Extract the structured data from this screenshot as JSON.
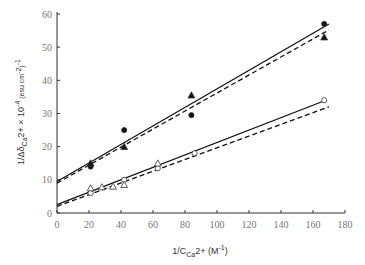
{
  "chart_data": {
    "type": "scatter",
    "title": "",
    "xlabel": "1/C_Ca2+ (M^-1)",
    "ylabel": "1/Δδ_Ca2+ × 10^-4 (esu cm^-2)^-1",
    "xlim": [
      0,
      180
    ],
    "ylim": [
      0,
      60
    ],
    "x_ticks": [
      0,
      20,
      40,
      60,
      80,
      100,
      120,
      140,
      160,
      180
    ],
    "y_ticks": [
      0,
      10,
      20,
      30,
      40,
      50,
      60
    ],
    "grid": false,
    "legend": null,
    "series": [
      {
        "name": "filled-circles",
        "marker": "circle-filled",
        "points": [
          [
            21,
            14
          ],
          [
            42,
            25
          ],
          [
            84,
            29.5
          ],
          [
            167,
            57
          ]
        ]
      },
      {
        "name": "filled-triangles",
        "marker": "triangle-filled",
        "points": [
          [
            21,
            15
          ],
          [
            42,
            20
          ],
          [
            84,
            35.5
          ],
          [
            167,
            53
          ]
        ]
      },
      {
        "name": "open-circles",
        "marker": "circle-open",
        "points": [
          [
            21,
            6
          ],
          [
            42,
            10
          ],
          [
            63,
            13.5
          ],
          [
            86,
            18
          ],
          [
            167,
            34
          ]
        ]
      },
      {
        "name": "open-triangles",
        "marker": "triangle-open",
        "points": [
          [
            21,
            7.5
          ],
          [
            28,
            7.8
          ],
          [
            35,
            8
          ],
          [
            42,
            8.5
          ],
          [
            63,
            15
          ]
        ]
      }
    ],
    "lines": [
      {
        "name": "upper-fit-solid",
        "style": "solid",
        "x": [
          0,
          170
        ],
        "y": [
          9.5,
          57
        ]
      },
      {
        "name": "upper-fit-dashed",
        "style": "dashed",
        "x": [
          0,
          170
        ],
        "y": [
          9.0,
          55.2
        ]
      },
      {
        "name": "lower-fit-solid",
        "style": "solid",
        "x": [
          0,
          168
        ],
        "y": [
          2.5,
          34
        ]
      },
      {
        "name": "lower-fit-dashed",
        "style": "dashed",
        "x": [
          0,
          170
        ],
        "y": [
          2.0,
          32
        ]
      }
    ]
  },
  "labels": {
    "x_main": "1/C",
    "x_sub": "Ca",
    "x_mid": "2+ (M",
    "x_sup": "-1",
    "x_end": ")",
    "y_main": "1/Δδ",
    "y_sub": "Ca",
    "y_mid": "2+ × 10",
    "y_sup": "-4",
    "y_unit": " (esu cm",
    "y_unit_sup": "-2",
    "y_unit_end": ")",
    "y_end_sup": "-1"
  }
}
